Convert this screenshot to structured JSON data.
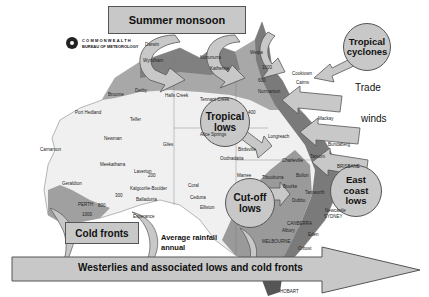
{
  "title": "Summer monsoon",
  "logo": {
    "line1": "COMMONWEALTH",
    "line2": "BUREAU OF METEOROLOGY"
  },
  "systems": {
    "summer_monsoon": "Summer monsoon",
    "tropical_cyclones": [
      "Tropical",
      "cyclones"
    ],
    "trade": "Trade",
    "winds": "winds",
    "tropical_lows": [
      "Tropical",
      "lows"
    ],
    "cut_off_lows": [
      "Cut-off",
      "lows"
    ],
    "east_coast_lows": [
      "East",
      "coast",
      "lows"
    ],
    "cold_fronts": "Cold fronts",
    "westerlies": "Westerlies and associated lows and cold fronts"
  },
  "map_caption": [
    "Average rainfall",
    "annual"
  ],
  "cities": [
    {
      "name": "Darwin"
    },
    {
      "name": "Wyndham"
    },
    {
      "name": "Kununurra"
    },
    {
      "name": "Katherine"
    },
    {
      "name": "Weipa"
    },
    {
      "name": "Cooktown"
    },
    {
      "name": "Cairns"
    },
    {
      "name": "Normanton"
    },
    {
      "name": "Broome"
    },
    {
      "name": "Derby"
    },
    {
      "name": "Halls Creek"
    },
    {
      "name": "Tennant Creek"
    },
    {
      "name": "Port Hedland"
    },
    {
      "name": "Telfer"
    },
    {
      "name": "Newman"
    },
    {
      "name": "Giles"
    },
    {
      "name": "Alice Springs"
    },
    {
      "name": "Longreach"
    },
    {
      "name": "Mackay"
    },
    {
      "name": "Bundaberg"
    },
    {
      "name": "Birdsville"
    },
    {
      "name": "Oodnadatta"
    },
    {
      "name": "Charleville"
    },
    {
      "name": "Taroom"
    },
    {
      "name": "BRISBANE"
    },
    {
      "name": "Carnarvon"
    },
    {
      "name": "Meekatharra"
    },
    {
      "name": "Laverton"
    },
    {
      "name": "Geraldton"
    },
    {
      "name": "Kalgoorlie-Boulder"
    },
    {
      "name": "Balladonia"
    },
    {
      "name": "PERTH"
    },
    {
      "name": "Esperance"
    },
    {
      "name": "Coral"
    },
    {
      "name": "Ceduna"
    },
    {
      "name": "Elliston"
    },
    {
      "name": "Marree"
    },
    {
      "name": "Tibooburra"
    },
    {
      "name": "Bollon"
    },
    {
      "name": "Bourke"
    },
    {
      "name": "Dubbo"
    },
    {
      "name": "Tamworth"
    },
    {
      "name": "Newcastle"
    },
    {
      "name": "SYDNEY"
    },
    {
      "name": "CANBERRA"
    },
    {
      "name": "Albury"
    },
    {
      "name": "Eden"
    },
    {
      "name": "MELBOURNE"
    },
    {
      "name": "Orbost"
    },
    {
      "name": "HOBART"
    }
  ],
  "isohyets": [
    "300",
    "400",
    "600",
    "800",
    "1000",
    "200",
    "1200"
  ],
  "colors": {
    "box_fill": "#c8c8c8",
    "border": "#555555",
    "map_dark": "#6e6e6e",
    "map_mid": "#9a9a9a",
    "map_light": "#d4d4d4",
    "map_bg": "#f2f2f2"
  }
}
